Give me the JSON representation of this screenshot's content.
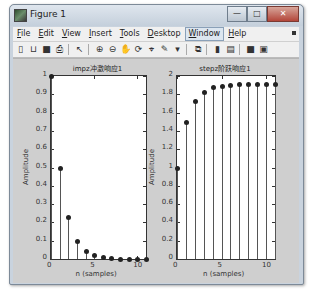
{
  "window": {
    "title": "Figure 1",
    "buttons": {
      "minimize": "—",
      "maximize": "□",
      "close": "✕"
    }
  },
  "menubar": {
    "items": [
      {
        "label": "File",
        "underline": "F"
      },
      {
        "label": "Edit",
        "underline": "E"
      },
      {
        "label": "View",
        "underline": "V"
      },
      {
        "label": "Insert",
        "underline": "I"
      },
      {
        "label": "Tools",
        "underline": "T"
      },
      {
        "label": "Desktop",
        "underline": "D"
      },
      {
        "label": "Window",
        "underline": "W",
        "active": true
      },
      {
        "label": "Help",
        "underline": "H"
      }
    ]
  },
  "toolbar": {
    "buttons": [
      {
        "name": "new-figure-icon",
        "glyph": "▯"
      },
      {
        "name": "open-file-icon",
        "glyph": "⊔"
      },
      {
        "name": "save-icon",
        "glyph": "■"
      },
      {
        "name": "print-icon",
        "glyph": "⎙"
      },
      {
        "sep": true
      },
      {
        "name": "pointer-icon",
        "glyph": "↖"
      },
      {
        "sep": true
      },
      {
        "name": "zoom-in-icon",
        "glyph": "⊕"
      },
      {
        "name": "zoom-out-icon",
        "glyph": "⊖"
      },
      {
        "name": "pan-icon",
        "glyph": "✋"
      },
      {
        "name": "rotate-3d-icon",
        "glyph": "⟳"
      },
      {
        "name": "data-cursor-icon",
        "glyph": "⌖"
      },
      {
        "name": "brush-icon",
        "glyph": "✎"
      },
      {
        "name": "brush-dropdown-icon",
        "glyph": "▾"
      },
      {
        "sep": true
      },
      {
        "name": "link-plot-icon",
        "glyph": "⧉"
      },
      {
        "sep": true
      },
      {
        "name": "colorbar-icon",
        "glyph": "▮"
      },
      {
        "name": "legend-icon",
        "glyph": "▤"
      },
      {
        "sep": true
      },
      {
        "name": "hide-plot-tools-icon",
        "glyph": "■"
      },
      {
        "name": "show-plot-tools-icon",
        "glyph": "▣"
      }
    ]
  },
  "chart_data": [
    {
      "type": "stem",
      "title": "impz冲激响应1",
      "xlabel": "n (samples)",
      "ylabel": "Amplitude",
      "xlim": [
        0,
        11
      ],
      "ylim": [
        0,
        1
      ],
      "xticks": [
        0,
        5,
        10
      ],
      "yticks": [
        0,
        0.1,
        0.2,
        0.3,
        0.4,
        0.5,
        0.6,
        0.7,
        0.8,
        0.9,
        1
      ],
      "ytick_labels": [
        "0",
        "0.1",
        "0.2",
        "0.3",
        "0.4",
        "0.5",
        "0.6",
        "0.7",
        "0.8",
        "0.9",
        "1"
      ],
      "x": [
        0,
        1,
        2,
        3,
        4,
        5,
        6,
        7,
        8,
        9,
        10,
        11
      ],
      "values": [
        1.0,
        0.5,
        0.23,
        0.1,
        0.045,
        0.02,
        0.01,
        0.004,
        0.002,
        0.001,
        0.0,
        0.0
      ]
    },
    {
      "type": "stem",
      "title": "stepz阶跃响应1",
      "xlabel": "n (samples)",
      "ylabel": "Amplitude",
      "xlim": [
        0,
        11
      ],
      "ylim": [
        0,
        2
      ],
      "xticks": [
        0,
        5,
        10
      ],
      "yticks": [
        0,
        0.2,
        0.4,
        0.6,
        0.8,
        1,
        1.2,
        1.4,
        1.6,
        1.8,
        2
      ],
      "ytick_labels": [
        "0",
        "0.2",
        "0.4",
        "0.6",
        "0.8",
        "1",
        "1.2",
        "1.4",
        "1.6",
        "1.8",
        "2"
      ],
      "x": [
        0,
        1,
        2,
        3,
        4,
        5,
        6,
        7,
        8,
        9,
        10,
        11
      ],
      "values": [
        1.0,
        1.5,
        1.73,
        1.83,
        1.875,
        1.895,
        1.905,
        1.91,
        1.912,
        1.913,
        1.913,
        1.913
      ]
    }
  ]
}
